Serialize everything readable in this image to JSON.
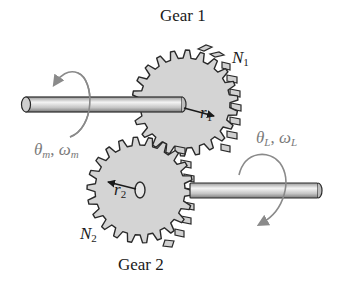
{
  "diagram": {
    "gear1": {
      "label": "Gear 1",
      "teeth_symbol": "N",
      "teeth_subscript": "1",
      "radius_symbol": "r",
      "radius_subscript": "1"
    },
    "gear2": {
      "label": "Gear 2",
      "teeth_symbol": "N",
      "teeth_subscript": "2",
      "radius_symbol": "r",
      "radius_subscript": "2"
    },
    "motor_shaft": {
      "angle_symbol": "θ",
      "angle_subscript": "m",
      "separator": ", ",
      "speed_symbol": "ω",
      "speed_subscript": "m"
    },
    "load_shaft": {
      "angle_symbol": "θ",
      "angle_subscript": "L",
      "separator": ", ",
      "speed_symbol": "ω",
      "speed_subscript": "L"
    },
    "colors": {
      "gear_fill": "#d4d4d4",
      "gear_outline": "#2a2a2a",
      "shaft_light": "#f2f2f2",
      "shaft_dark": "#8c8c8c",
      "rotation_arrow": "#8a8a8a",
      "label_text": "#1a1a1a",
      "shaft_label_text": "#7a7a7a"
    }
  }
}
